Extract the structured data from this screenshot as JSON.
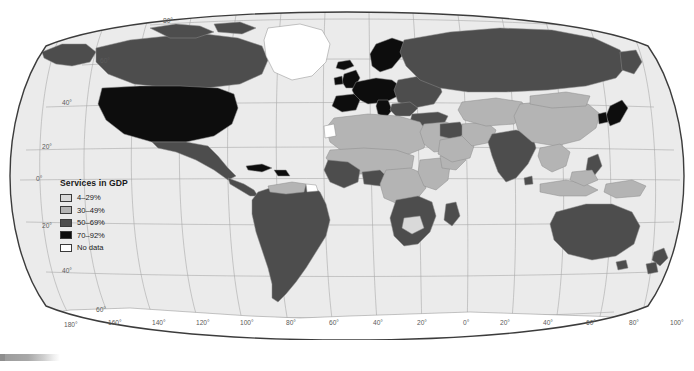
{
  "figure": {
    "kind": "world-choropleth-map",
    "projection": "Robinson",
    "background_color": "#ffffff",
    "ocean_color": "#ebebeb",
    "graticule_color": "#a9a9a9",
    "border_color": "#3c3c3c",
    "country_outline_color": "#8c8c8c"
  },
  "legend": {
    "title": "Services in GDP",
    "items": [
      {
        "label": "4–29%",
        "color": "#d9d9d9"
      },
      {
        "label": "30–49%",
        "color": "#b4b4b4"
      },
      {
        "label": "50–69%",
        "color": "#4d4d4d"
      },
      {
        "label": "70–92%",
        "color": "#0d0d0d"
      },
      {
        "label": "No data",
        "color": "#ffffff"
      }
    ]
  },
  "graticule": {
    "latitude_labels": [
      "80°",
      "60°",
      "40°",
      "20°",
      "0°",
      "20°",
      "40°",
      "60°"
    ],
    "longitude_labels": [
      "180°",
      "160°",
      "140°",
      "120°",
      "100°",
      "80°",
      "60°",
      "40°",
      "20°",
      "0°",
      "20°",
      "40°",
      "60°",
      "80°",
      "100°",
      "120°",
      "140°",
      "160°",
      "180°"
    ],
    "latitude_label_positions": [
      {
        "text": "80°",
        "x": 163,
        "y": 22
      },
      {
        "text": "60°",
        "x": 100,
        "y": 62
      },
      {
        "text": "40°",
        "x": 62,
        "y": 104
      },
      {
        "text": "20°",
        "x": 40,
        "y": 148
      },
      {
        "text": "0°",
        "x": 34,
        "y": 180
      },
      {
        "text": "20°",
        "x": 40,
        "y": 227
      },
      {
        "text": "40°",
        "x": 62,
        "y": 272
      },
      {
        "text": "60°",
        "x": 96,
        "y": 311
      }
    ],
    "longitude_label_positions": [
      {
        "text": "180°",
        "x": 71,
        "y": 322
      },
      {
        "text": "160°",
        "x": 113,
        "y": 319
      },
      {
        "text": "140°",
        "x": 157,
        "y": 319
      },
      {
        "text": "120°",
        "x": 201,
        "y": 319
      },
      {
        "text": "100°",
        "x": 245,
        "y": 319
      },
      {
        "text": "80°",
        "x": 291,
        "y": 319
      },
      {
        "text": "60°",
        "x": 334,
        "y": 319
      },
      {
        "text": "40°",
        "x": 378,
        "y": 319
      },
      {
        "text": "20°",
        "x": 422,
        "y": 319
      },
      {
        "text": "0°",
        "x": 467,
        "y": 319
      },
      {
        "text": "20°",
        "x": 508,
        "y": 319
      },
      {
        "text": "40°",
        "x": 551,
        "y": 319
      },
      {
        "text": "60°",
        "x": 594,
        "y": 319
      },
      {
        "text": "80°",
        "x": 637,
        "y": 319
      },
      {
        "text": "100°",
        "x": 679,
        "y": 319
      },
      {
        "text": "120°",
        "x": 722,
        "y": 319
      },
      {
        "text": "140°",
        "x": 765,
        "y": 319
      },
      {
        "text": "160°",
        "x": 808,
        "y": 319
      },
      {
        "text": "180°",
        "x": 851,
        "y": 319
      }
    ]
  },
  "map_regions": [
    {
      "name": "greenland",
      "class": "no-data"
    },
    {
      "name": "antarctica",
      "class": "no-data"
    },
    {
      "name": "western-sahara",
      "class": "no-data"
    },
    {
      "name": "canada",
      "class": "cat-50-69"
    },
    {
      "name": "united-states",
      "class": "cat-70-92"
    },
    {
      "name": "mexico",
      "class": "cat-50-69"
    },
    {
      "name": "central-america",
      "class": "cat-50-69"
    },
    {
      "name": "caribbean",
      "class": "cat-70-92"
    },
    {
      "name": "south-america",
      "class": "cat-50-69"
    },
    {
      "name": "venezuela",
      "class": "cat-30-49"
    },
    {
      "name": "guyana-region",
      "class": "no-data"
    },
    {
      "name": "western-europe",
      "class": "cat-70-92"
    },
    {
      "name": "eastern-europe",
      "class": "cat-50-69"
    },
    {
      "name": "scandinavia",
      "class": "cat-70-92"
    },
    {
      "name": "united-kingdom",
      "class": "cat-70-92"
    },
    {
      "name": "france",
      "class": "cat-70-92"
    },
    {
      "name": "italy",
      "class": "cat-70-92"
    },
    {
      "name": "russia",
      "class": "cat-50-69"
    },
    {
      "name": "north-africa",
      "class": "cat-30-49"
    },
    {
      "name": "sahel",
      "class": "cat-30-49"
    },
    {
      "name": "west-africa",
      "class": "cat-50-69"
    },
    {
      "name": "central-africa",
      "class": "cat-30-49"
    },
    {
      "name": "east-africa",
      "class": "cat-30-49"
    },
    {
      "name": "southern-africa",
      "class": "cat-50-69"
    },
    {
      "name": "botswana",
      "class": "cat-4-29"
    },
    {
      "name": "middle-east",
      "class": "cat-30-49"
    },
    {
      "name": "saudi-arabia",
      "class": "cat-30-49"
    },
    {
      "name": "iraq",
      "class": "cat-50-69"
    },
    {
      "name": "central-asia",
      "class": "cat-30-49"
    },
    {
      "name": "india",
      "class": "cat-50-69"
    },
    {
      "name": "china",
      "class": "cat-30-49"
    },
    {
      "name": "japan",
      "class": "cat-70-92"
    },
    {
      "name": "korea",
      "class": "cat-70-92"
    },
    {
      "name": "southeast-asia",
      "class": "cat-30-49"
    },
    {
      "name": "indonesia",
      "class": "cat-30-49"
    },
    {
      "name": "philippines",
      "class": "cat-50-69"
    },
    {
      "name": "papua-new-guinea",
      "class": "cat-30-49"
    },
    {
      "name": "australia",
      "class": "cat-50-69"
    },
    {
      "name": "new-zealand",
      "class": "cat-50-69"
    },
    {
      "name": "madagascar",
      "class": "cat-50-69"
    }
  ],
  "scrollbar": {
    "orientation": "horizontal",
    "position": "bottom"
  }
}
